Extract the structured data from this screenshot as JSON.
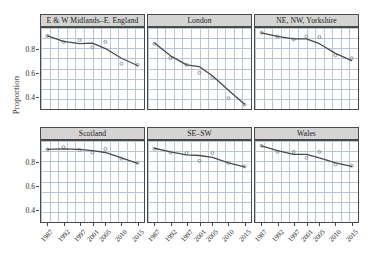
{
  "chart_data": {
    "type": "line",
    "title": "",
    "xlabel": "",
    "ylabel": "Proportion",
    "x": [
      1987,
      1992,
      1997,
      2001,
      2005,
      2010,
      2015
    ],
    "xticklabels": [
      "1987",
      "1992",
      "1997",
      "2001",
      "2005",
      "2010",
      "2015"
    ],
    "xlim": [
      1985,
      2017
    ],
    "ylim": [
      0.3,
      0.97
    ],
    "yticks": [
      0.4,
      0.6,
      0.8
    ],
    "yticklabels": [
      "0.4",
      "0.6",
      "0.8"
    ],
    "grid": true,
    "legend": false,
    "facet_layout": {
      "rows": 2,
      "cols": 3
    },
    "point_color": "#8c8c8c",
    "line_color": "#4a4a4a",
    "grid_color": "#b9c6d6",
    "strip_color": "#d4d4d4",
    "panels": [
      {
        "label": "E & W Midlands–E. England",
        "points": [
          0.905,
          0.855,
          0.87,
          0.81,
          0.855,
          0.675,
          0.665
        ],
        "fit": [
          0.905,
          0.86,
          0.84,
          0.845,
          0.8,
          0.72,
          0.66
        ]
      },
      {
        "label": "London",
        "points": [
          0.84,
          0.72,
          0.665,
          0.6,
          0.56,
          0.39,
          0.335
        ],
        "fit": [
          0.845,
          0.74,
          0.665,
          0.65,
          0.575,
          0.455,
          0.34
        ]
      },
      {
        "label": "NE, NW, Yorkshire",
        "points": [
          0.93,
          0.9,
          0.875,
          0.9,
          0.895,
          0.745,
          0.72
        ],
        "fit": [
          0.93,
          0.9,
          0.88,
          0.88,
          0.84,
          0.76,
          0.7
        ]
      },
      {
        "label": "Scotland",
        "points": [
          0.9,
          0.92,
          0.895,
          0.875,
          0.905,
          0.825,
          0.79
        ],
        "fit": [
          0.9,
          0.905,
          0.9,
          0.89,
          0.875,
          0.83,
          0.785
        ]
      },
      {
        "label": "SE–SW",
        "points": [
          0.905,
          0.875,
          0.87,
          0.805,
          0.87,
          0.79,
          0.76
        ],
        "fit": [
          0.91,
          0.88,
          0.855,
          0.85,
          0.835,
          0.79,
          0.755
        ]
      },
      {
        "label": "Wales",
        "points": [
          0.93,
          0.88,
          0.88,
          0.83,
          0.88,
          0.775,
          0.765
        ],
        "fit": [
          0.93,
          0.89,
          0.86,
          0.86,
          0.83,
          0.79,
          0.76
        ]
      }
    ]
  }
}
